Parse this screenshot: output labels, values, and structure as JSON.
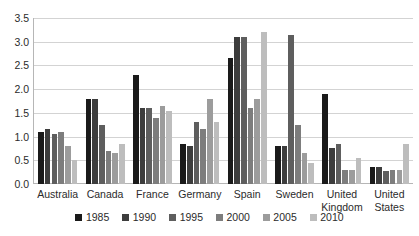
{
  "chart_data": {
    "type": "bar",
    "title": "",
    "subtitle": "",
    "xlabel": "",
    "ylabel": "",
    "ylim": [
      0,
      3.5
    ],
    "ytick_values": [
      0.0,
      0.5,
      1.0,
      1.5,
      2.0,
      2.5,
      3.0,
      3.5
    ],
    "ytick_labels": [
      "0.0",
      "0.5",
      "1.0",
      "1.5",
      "2.0",
      "2.5",
      "3.0",
      "3.5"
    ],
    "grid": true,
    "legend_position": "bottom",
    "categories": [
      "Australia",
      "Canada",
      "France",
      "Germany",
      "Spain",
      "Sweden",
      "United Kingdom",
      "United States"
    ],
    "series": [
      {
        "name": "1985",
        "color": "#1a1a1a",
        "values": [
          1.1,
          1.8,
          2.3,
          0.85,
          2.65,
          0.8,
          1.9,
          0.35
        ]
      },
      {
        "name": "1990",
        "color": "#3d3d3d",
        "values": [
          1.15,
          1.8,
          1.6,
          0.8,
          3.1,
          0.8,
          0.75,
          0.35
        ]
      },
      {
        "name": "1995",
        "color": "#5e5e5e",
        "values": [
          1.05,
          1.25,
          1.6,
          1.3,
          3.1,
          3.15,
          0.85,
          0.28
        ]
      },
      {
        "name": "2000",
        "color": "#7d7d7d",
        "values": [
          1.1,
          0.7,
          1.4,
          1.15,
          1.6,
          1.25,
          0.3,
          0.3
        ]
      },
      {
        "name": "2005",
        "color": "#9c9c9c",
        "values": [
          0.8,
          0.65,
          1.65,
          1.8,
          1.8,
          0.65,
          0.3,
          0.3
        ]
      },
      {
        "name": "2010",
        "color": "#bdbdbd",
        "values": [
          0.5,
          0.85,
          1.55,
          1.3,
          3.2,
          0.45,
          0.55,
          0.85
        ]
      }
    ]
  },
  "axis": {
    "y_axis_color": "#b6b6b6",
    "grid_color": "#d3d3d3"
  }
}
